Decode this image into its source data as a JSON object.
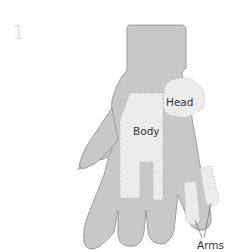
{
  "step": {
    "number": "1"
  },
  "diagram": {
    "labels": {
      "head": "Head",
      "body": "Body",
      "arms": "Arms"
    },
    "colors": {
      "glove": "#c8c8c8",
      "glove_outline": "#8a8a8a",
      "piece": "#ececec",
      "piece_stitch": "#b5b5b5",
      "label_text": "#333333",
      "step_number": "#d0d0d0"
    }
  }
}
